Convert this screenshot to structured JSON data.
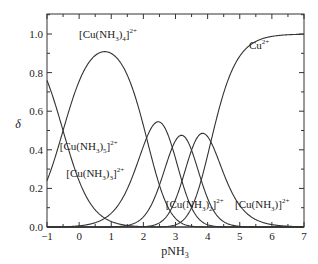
{
  "chart_data": {
    "type": "line",
    "title": "",
    "xlabel": "pNH3",
    "ylabel": "δ",
    "xlim": [
      -1,
      7
    ],
    "ylim": [
      0,
      1.1
    ],
    "xticks": [
      "-1",
      "0",
      "1",
      "2",
      "3",
      "4",
      "5",
      "6",
      "7"
    ],
    "yticks": [
      "0.0",
      "0.2",
      "0.4",
      "0.6",
      "0.8",
      "1.0"
    ],
    "grid": false,
    "legend": "inline labels",
    "stepwise_logK": [
      4.1,
      3.5,
      2.9,
      2.1,
      -0.5
    ],
    "series": [
      {
        "name": "Cu2+",
        "label": "Cu",
        "sup": "2+",
        "peak": {
          "x": 7,
          "y": 1.0
        }
      },
      {
        "name": "[Cu(NH3)]2+",
        "label": "[Cu(NH",
        "sub": "3",
        "tail": ")]",
        "sup": "2+",
        "peak": {
          "x": 3.8,
          "y": 0.49
        }
      },
      {
        "name": "[Cu(NH3)2]2+",
        "label": "[Cu(NH",
        "sub": "3",
        "tail": ")2]",
        "sup": "2+",
        "peak": {
          "x": 3.2,
          "y": 0.46
        }
      },
      {
        "name": "[Cu(NH3)3]2+",
        "label": "[Cu(NH",
        "sub": "3",
        "tail": ")3]",
        "sup": "2+",
        "peak": {
          "x": 2.5,
          "y": 0.51
        }
      },
      {
        "name": "[Cu(NH3)4]2+",
        "label": "[Cu(NH",
        "sub": "3",
        "tail": ")4]",
        "sup": "2+",
        "peak": {
          "x": 0.8,
          "y": 0.92
        }
      },
      {
        "name": "[Cu(NH3)5]2+",
        "label": "[Cu(NH",
        "sub": "3",
        "tail": ")5]",
        "sup": "2+",
        "peak": {
          "x": -1,
          "y": 0.78
        }
      }
    ],
    "annotations": [
      {
        "text": "[Cu(NH3)4]2+",
        "x": 0.9,
        "y": 0.98
      },
      {
        "text": "Cu2+",
        "x": 5.6,
        "y": 0.92
      },
      {
        "text": "[Cu(NH3)5]2+",
        "x": 0.3,
        "y": 0.4
      },
      {
        "text": "[Cu(NH3)3]2+",
        "x": 0.5,
        "y": 0.26
      },
      {
        "text": "[Cu(NH3)2]2+",
        "x": 3.6,
        "y": 0.1
      },
      {
        "text": "[Cu(NH3)]2+",
        "x": 5.7,
        "y": 0.1
      }
    ]
  }
}
